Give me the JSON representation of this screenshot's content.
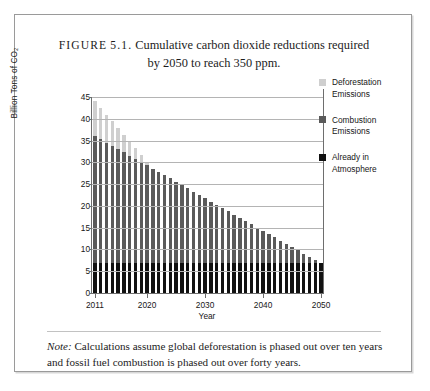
{
  "figure": {
    "label": "FIGURE",
    "number": "5.1.",
    "caption_line1": "Cumulative carbon dioxide reductions required",
    "caption_line2": "by 2050 to reach 350 ppm."
  },
  "note": {
    "word": "Note:",
    "text": " Calculations assume global deforestation is phased out over ten years and fossil fuel combustion is phased out over forty years."
  },
  "legend": {
    "position": "right",
    "items": [
      {
        "label": "Deforestation Emissions",
        "color": "#cfcfcf",
        "swatch_name": "deforestation"
      },
      {
        "label": "Combustion Emissions",
        "color": "#5a5a5a",
        "swatch_name": "combustion"
      },
      {
        "label": "Already in Atmosphere",
        "color": "#111111",
        "swatch_name": "already-in-atmosphere"
      }
    ]
  },
  "chart_data": {
    "type": "bar",
    "stacked": true,
    "title": "Cumulative carbon dioxide reductions required by 2050 to reach 350 ppm.",
    "xlabel": "Year",
    "ylabel": "Billion Tons of CO₂",
    "ylim": [
      0,
      45
    ],
    "ytick_step": 5,
    "yticks": [
      0,
      5,
      10,
      15,
      20,
      25,
      30,
      35,
      40,
      45
    ],
    "grid": true,
    "grid_axis": "y",
    "xticks": [
      2011,
      2020,
      2030,
      2040,
      2050
    ],
    "xlim": [
      2011,
      2050
    ],
    "categories": [
      2011,
      2012,
      2013,
      2014,
      2015,
      2016,
      2017,
      2018,
      2019,
      2020,
      2021,
      2022,
      2023,
      2024,
      2025,
      2026,
      2027,
      2028,
      2029,
      2030,
      2031,
      2032,
      2033,
      2034,
      2035,
      2036,
      2037,
      2038,
      2039,
      2040,
      2041,
      2042,
      2043,
      2044,
      2045,
      2046,
      2047,
      2048,
      2049,
      2050
    ],
    "series": [
      {
        "name": "Already in Atmosphere",
        "color": "#111111",
        "values": [
          7,
          7,
          7,
          7,
          7,
          7,
          7,
          7,
          7,
          7,
          7,
          7,
          7,
          7,
          7,
          7,
          7,
          7,
          7,
          7,
          7,
          7,
          7,
          7,
          7,
          7,
          7,
          7,
          7,
          7,
          7,
          7,
          7,
          7,
          7,
          7,
          7,
          7,
          7,
          7
        ]
      },
      {
        "name": "Combustion Emissions",
        "color": "#5a5a5a",
        "values": [
          29.0,
          28.3,
          27.5,
          26.8,
          26.0,
          25.3,
          24.5,
          23.8,
          23.0,
          22.3,
          21.5,
          20.8,
          20.0,
          19.3,
          18.5,
          17.8,
          17.0,
          16.3,
          15.5,
          14.8,
          14.0,
          13.3,
          12.5,
          11.8,
          11.0,
          10.3,
          9.5,
          8.8,
          8.0,
          7.3,
          6.5,
          5.8,
          5.0,
          4.3,
          3.5,
          2.8,
          2.0,
          1.3,
          0.5,
          0.0
        ]
      },
      {
        "name": "Deforestation Emissions",
        "color": "#cfcfcf",
        "values": [
          8.0,
          7.2,
          6.4,
          5.6,
          4.8,
          4.0,
          3.2,
          2.4,
          1.6,
          0.8,
          0,
          0,
          0,
          0,
          0,
          0,
          0,
          0,
          0,
          0,
          0,
          0,
          0,
          0,
          0,
          0,
          0,
          0,
          0,
          0,
          0,
          0,
          0,
          0,
          0,
          0,
          0,
          0,
          0,
          0
        ]
      }
    ],
    "totals": [
      44.0,
      42.5,
      40.9,
      39.4,
      37.8,
      36.3,
      34.7,
      33.2,
      31.6,
      30.1,
      28.5,
      27.8,
      27.0,
      26.3,
      25.5,
      24.8,
      24.0,
      23.3,
      22.5,
      21.8,
      21.0,
      20.3,
      19.5,
      18.8,
      18.0,
      17.3,
      16.5,
      15.8,
      15.0,
      14.3,
      13.5,
      12.8,
      12.0,
      11.3,
      10.5,
      9.8,
      9.0,
      8.3,
      7.5,
      7.0
    ]
  }
}
